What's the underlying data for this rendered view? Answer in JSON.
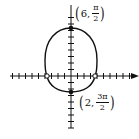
{
  "chart_data": {
    "type": "line",
    "title": "",
    "xlabel": "",
    "ylabel": "",
    "grid": false,
    "axes": {
      "x_ticks_each_side": 9,
      "y_ticks_each_side": 9,
      "x_axis_arrow": "right"
    },
    "points": [
      {
        "r": 6,
        "theta": "π/2",
        "label": "(6, π/2)",
        "marker": "filled"
      },
      {
        "r": 2,
        "theta": "3π/2",
        "label": "(2, 3π/2)",
        "marker": "filled"
      },
      {
        "r": 4,
        "theta": "0",
        "marker": "open"
      },
      {
        "r": 4,
        "theta": "π",
        "marker": "open"
      }
    ]
  },
  "labels": {
    "top": {
      "r": "6",
      "theta_num": "π",
      "theta_den": "2"
    },
    "bottom": {
      "r": "2",
      "theta_num": "3π",
      "theta_den": "2"
    }
  },
  "colors": {
    "ink": "#111111",
    "background": "#ffffff"
  }
}
